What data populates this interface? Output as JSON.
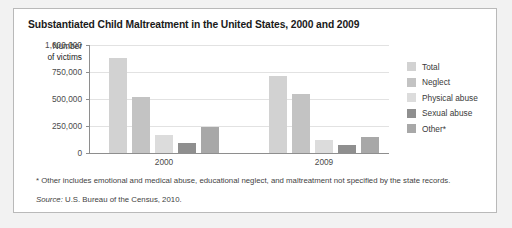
{
  "chart_data": {
    "type": "bar",
    "title": "Substantiated Child Maltreatment in the United States, 2000 and 2009",
    "categories": [
      "2000",
      "2009"
    ],
    "series": [
      {
        "name": "Total",
        "values": [
          880000,
          715000
        ],
        "color": "#d2d2d2"
      },
      {
        "name": "Neglect",
        "values": [
          520000,
          545000
        ],
        "color": "#c3c3c3"
      },
      {
        "name": "Physical abuse",
        "values": [
          170000,
          125000
        ],
        "color": "#dcdcdc"
      },
      {
        "name": "Sexual abuse",
        "values": [
          90000,
          70000
        ],
        "color": "#8f8f8f"
      },
      {
        "name": "Other*",
        "values": [
          240000,
          145000
        ],
        "color": "#a8a8a8"
      }
    ],
    "xlabel": "",
    "ylabel": "Number of victims",
    "ylim": [
      0,
      1000000
    ],
    "yticks": [
      0,
      250000,
      500000,
      750000,
      1000000
    ],
    "ytick_labels": [
      "0",
      "250,000",
      "500,000",
      "750,000",
      "1,000,000"
    ],
    "grid": true,
    "legend_position": "right"
  },
  "axis": {
    "y_title_line1": "Number",
    "y_title_line2": "of victims"
  },
  "notes": {
    "footnote": "* Other includes emotional and medical abuse, educational neglect, and maltreatment not specified by the state records.",
    "source_word": "Source:",
    "source_text": " U.S. Bureau of the Census, 2010."
  }
}
